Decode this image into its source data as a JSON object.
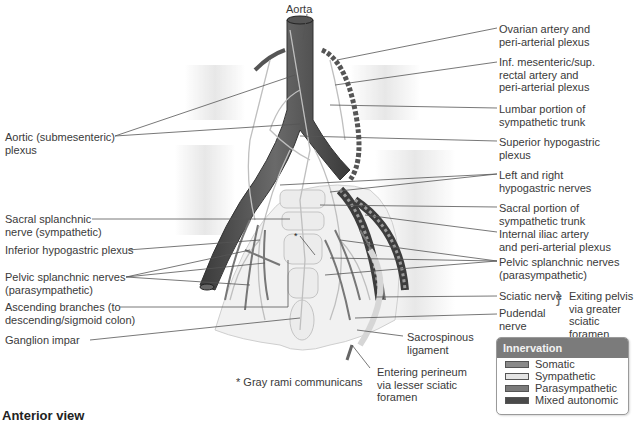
{
  "figure": {
    "caption": "Anterior view",
    "footnote": "* Gray rami communicans"
  },
  "labels": {
    "aorta": "Aorta",
    "aortic_plexus": [
      "Aortic (submesenteric)",
      "plexus"
    ],
    "sacral_splanchnic": [
      "Sacral splanchnic",
      "nerve (sympathetic)"
    ],
    "inferior_hypogastric": "Inferior hypogastric plexus",
    "pelvic_splanchnic_left": [
      "Pelvic splanchnic nerves",
      "(parasympathetic)"
    ],
    "ascending_branches": [
      "Ascending branches (to",
      "descending/sigmoid colon)"
    ],
    "ganglion_impar": "Ganglion impar",
    "ovarian_artery": [
      "Ovarian artery and",
      "peri-arterial plexus"
    ],
    "inf_mesenteric": [
      "Inf. mesenteric/sup.",
      "rectal artery and",
      "peri-arterial plexus"
    ],
    "lumbar_trunk": [
      "Lumbar portion of",
      "sympathetic trunk"
    ],
    "superior_hypogastric": [
      "Superior hypogastric",
      "plexus"
    ],
    "hypogastric_nerves": [
      "Left and right",
      "hypogastric nerves"
    ],
    "sacral_trunk": [
      "Sacral portion of",
      "sympathetic trunk"
    ],
    "internal_iliac": [
      "Internal iliac artery",
      "and peri-arterial plexus"
    ],
    "pelvic_splanchnic_right": [
      "Pelvic splanchnic nerves",
      "(parasympathetic)"
    ],
    "sciatic_nerve": "Sciatic nerve",
    "pudendal_nerve": [
      "Pudendal",
      "nerve"
    ],
    "exiting_pelvis": [
      "Exiting pelvis",
      "via greater",
      "sciatic",
      "foramen"
    ],
    "sacrospinous": [
      "Sacrospinous",
      "ligament"
    ],
    "entering_perineum": [
      "Entering perineum",
      "via lesser sciatic",
      "foramen"
    ]
  },
  "legend": {
    "title": "Innervation",
    "items": [
      {
        "label": "Somatic",
        "color": "#8a8a8a"
      },
      {
        "label": "Sympathetic",
        "color": "#e4e4e4"
      },
      {
        "label": "Parasympathetic",
        "color": "#7a7a7a"
      },
      {
        "label": "Mixed autonomic",
        "color": "#4a4a4a"
      }
    ]
  },
  "colors": {
    "aorta": "#4d4d4d",
    "nerve_light": "#d8d8d8",
    "nerve_dark": "#6e6e6e",
    "leader": "#555555",
    "legend_header": "#7b7b7b"
  }
}
